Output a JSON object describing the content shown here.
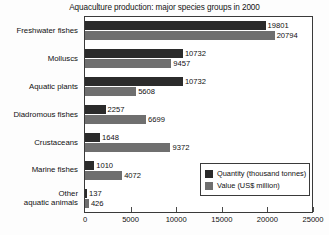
{
  "chart_data": {
    "type": "bar",
    "orientation": "horizontal",
    "title": "Aquaculture production: major species groups in 2000",
    "xlabel": "",
    "ylabel": "",
    "xlim": [
      0,
      25000
    ],
    "grid": false,
    "legend_position": "bottom-right",
    "xticks": [
      "0",
      "5000",
      "10000",
      "15000",
      "20000",
      "25000"
    ],
    "xtick_values": [
      0,
      5000,
      10000,
      15000,
      20000,
      25000
    ],
    "categories": [
      "Freshwater fishes",
      "Molluscs",
      "Aquatic plants",
      "Diadromous fishes",
      "Crustaceans",
      "Marine fishes",
      "Other aquatic animals"
    ],
    "category_lines": [
      [
        "Freshwater fishes"
      ],
      [
        "Molluscs"
      ],
      [
        "Aquatic plants"
      ],
      [
        "Diadromous fishes"
      ],
      [
        "Crustaceans"
      ],
      [
        "Marine fishes"
      ],
      [
        "Other",
        "aquatic animals"
      ]
    ],
    "series": [
      {
        "name": "Quantity (thousand tonnes)",
        "color": "#2b2b2b",
        "values": [
          19801,
          10732,
          10732,
          2257,
          1648,
          1010,
          137
        ]
      },
      {
        "name": "Value (US$ million)",
        "color": "#6f6f6f",
        "values": [
          20794,
          9457,
          5608,
          6699,
          9372,
          4072,
          426
        ]
      }
    ]
  }
}
